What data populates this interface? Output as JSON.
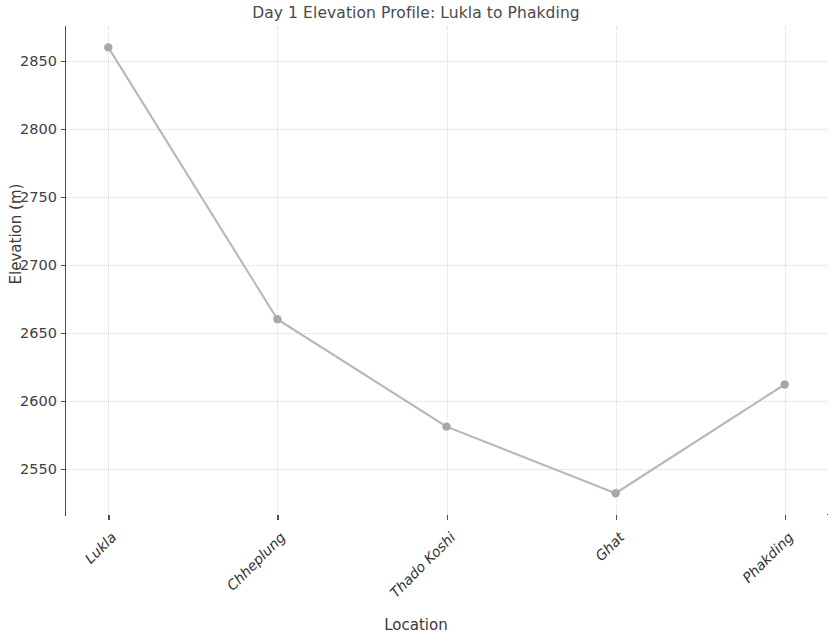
{
  "chart_data": {
    "type": "line",
    "title": "Day 1 Elevation Profile: Lukla to Phakding",
    "xlabel": "Location",
    "ylabel": "Elevation (m)",
    "categories": [
      "Lukla",
      "Chheplung",
      "Thado Koshi",
      "Ghat",
      "Phakding"
    ],
    "values": [
      2860,
      2660,
      2581,
      2532,
      2612
    ],
    "series": [
      {
        "name": "Elevation",
        "values": [
          2860,
          2660,
          2581,
          2532,
          2612
        ]
      }
    ],
    "ytick_labels": [
      "2550",
      "2600",
      "2650",
      "2700",
      "2750",
      "2800",
      "2850"
    ],
    "ytick_values": [
      2550,
      2600,
      2650,
      2700,
      2750,
      2800,
      2850
    ],
    "ylim": [
      2516,
      2875
    ],
    "xlim": [
      -0.25,
      4.25
    ],
    "grid": true,
    "grid_style": "dotted",
    "legend": "none",
    "marker": "circle",
    "colors": {
      "line": "#b8b8b8",
      "marker": "#a8a8a8",
      "grid": "#d9d9d9",
      "axis": "#4d4d4d",
      "text": "#3a3a3a",
      "background": "#ffffff"
    }
  }
}
